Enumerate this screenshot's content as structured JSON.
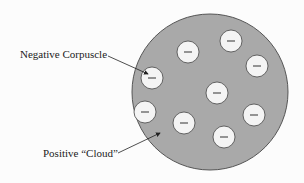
{
  "diagram": {
    "labels": {
      "negative": "Negative Corpuscle",
      "positive": "Positive “Cloud”"
    },
    "cloud": {
      "cx": 210,
      "cy": 92,
      "r": 78,
      "fill": "#a9a9a9",
      "stroke": "#555555"
    },
    "corpuscle_symbol": "−",
    "corpuscles": [
      {
        "cx": 188,
        "cy": 52
      },
      {
        "cx": 231,
        "cy": 41
      },
      {
        "cx": 257,
        "cy": 66
      },
      {
        "cx": 152,
        "cy": 78
      },
      {
        "cx": 217,
        "cy": 93
      },
      {
        "cx": 145,
        "cy": 112
      },
      {
        "cx": 184,
        "cy": 123
      },
      {
        "cx": 254,
        "cy": 115
      },
      {
        "cx": 224,
        "cy": 137
      }
    ],
    "corpuscle_r": 11
  }
}
